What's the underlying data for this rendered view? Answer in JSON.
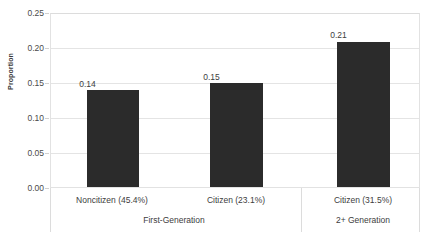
{
  "chart_data": {
    "type": "bar",
    "title": "",
    "xlabel": "",
    "ylabel": "Proportion",
    "ylim": [
      0.0,
      0.25
    ],
    "ytick_labels": [
      "0.25",
      "0.20",
      "0.15",
      "0.10",
      "0.05",
      "0.00"
    ],
    "ytick_values": [
      0.25,
      0.2,
      0.15,
      0.1,
      0.05,
      0.0
    ],
    "grid": true,
    "legend": "none",
    "categories": [
      "Noncitizen (45.4%)",
      "Citizen (23.1%)",
      "Citizen (31.5%)"
    ],
    "values": [
      0.14,
      0.15,
      0.21
    ],
    "value_labels": [
      "0.14",
      "0.15",
      "0.21"
    ],
    "bar_color": "#2b2b2b",
    "groups": [
      {
        "label": "First-Generation",
        "category_indices": [
          0,
          1
        ]
      },
      {
        "label": "2+ Generation",
        "category_indices": [
          2
        ]
      }
    ]
  }
}
